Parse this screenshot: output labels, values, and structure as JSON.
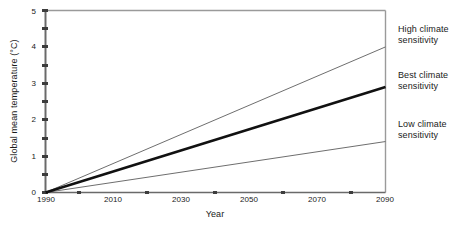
{
  "chart_data": {
    "type": "line",
    "title": "",
    "xlabel": "Year",
    "ylabel": "Global mean temperature (°C)",
    "xlim": [
      1990,
      2100
    ],
    "ylim": [
      0,
      5
    ],
    "grid": false,
    "legend_position": "right-outside",
    "x_ticks_major": [
      1990,
      2010,
      2030,
      2050,
      2070,
      2090
    ],
    "x_ticks_major_labels": [
      "1990",
      "2010",
      "2030",
      "2050",
      "2070",
      "2090"
    ],
    "x_ticks_minor": [
      2000,
      2020,
      2040,
      2060,
      2080,
      2100
    ],
    "y_ticks_major": [
      0,
      1,
      2,
      3,
      4,
      5
    ],
    "y_ticks_major_labels": [
      "0",
      "1",
      "2",
      "3",
      "4",
      "5"
    ],
    "y_ticks_minor": [
      0.5,
      1.5,
      2.5,
      3.5,
      4.5
    ],
    "x": [
      1990,
      2100
    ],
    "series": [
      {
        "name": "High climate sensitivity",
        "values": [
          0,
          4.0
        ],
        "color": "#6e6e6e",
        "width": 1
      },
      {
        "name": "Best climate sensitivity",
        "values": [
          0,
          2.9
        ],
        "color": "#111111",
        "width": 2.6
      },
      {
        "name": "Low climate sensitivity",
        "values": [
          0,
          1.4
        ],
        "color": "#6e6e6e",
        "width": 1
      }
    ]
  },
  "axes": {
    "y_title": "Global mean temperature (°C)",
    "x_title": "Year"
  },
  "legend": {
    "high": {
      "line1": "High climate",
      "line2": "sensitivity"
    },
    "best": {
      "line1": "Best climate",
      "line2": "sensitivity"
    },
    "low": {
      "line1": "Low climate",
      "line2": "sensitivity"
    }
  },
  "ticks": {
    "x": [
      "1990",
      "2010",
      "2030",
      "2050",
      "2070",
      "2090"
    ],
    "y": [
      "0",
      "1",
      "2",
      "3",
      "4",
      "5"
    ]
  },
  "colors": {
    "axis": "#6a6a6a",
    "best_line": "#111111",
    "bound_line": "#6e6e6e",
    "text": "#1a1a1a"
  }
}
